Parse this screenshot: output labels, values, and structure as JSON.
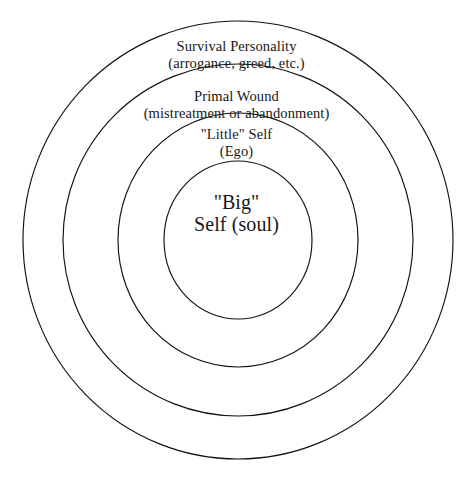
{
  "diagram": {
    "type": "concentric-circles",
    "background_color": "#ffffff",
    "stroke_color": "#111111",
    "text_color": "#171717",
    "center": {
      "x": 238,
      "y": 240
    },
    "rings": [
      {
        "index": 1,
        "name": "survival-personality",
        "radius_x": 215,
        "radius_y": 219,
        "label_line1": "Survival Personality",
        "label_line2": "(arrogance, greed, etc.)"
      },
      {
        "index": 2,
        "name": "primal-wound",
        "radius_x": 175,
        "radius_y": 176,
        "label_line1": "Primal Wound",
        "label_line2": "(mistreatment or abandonment)"
      },
      {
        "index": 3,
        "name": "little-self",
        "radius_x": 120,
        "radius_y": 127,
        "label_line1": "\"Little\" Self",
        "label_line2": "(Ego)"
      },
      {
        "index": 4,
        "name": "big-self",
        "radius_x": 74,
        "radius_y": 79,
        "label_line1": "\"Big\"",
        "label_line2": "Self (soul)"
      }
    ]
  }
}
